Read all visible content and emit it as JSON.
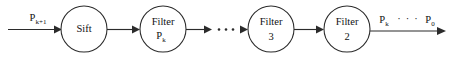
{
  "diagram": {
    "background_color": "#ffffff",
    "stroke_color": "#2b2b2b",
    "text_color": "#111111",
    "nodes": [
      {
        "id": "sift",
        "shape": "circle",
        "line1": "Sift",
        "line2": "",
        "line2_sub": "",
        "cx": 84,
        "cy": 29,
        "r": 23
      },
      {
        "id": "filter-pk",
        "shape": "circle",
        "line1": "Filter",
        "line2": "P",
        "line2_sub": "k",
        "cx": 163,
        "cy": 29,
        "r": 23
      },
      {
        "id": "filter-3",
        "shape": "circle",
        "line1": "Filter",
        "line2": "3",
        "line2_sub": "",
        "cx": 271,
        "cy": 29,
        "r": 23
      },
      {
        "id": "filter-2",
        "shape": "circle",
        "line1": "Filter",
        "line2": "2",
        "line2_sub": "",
        "cx": 347,
        "cy": 29,
        "r": 23
      }
    ],
    "edges": [
      {
        "id": "input-to-sift",
        "from": "input",
        "to": "sift",
        "label_base": "P",
        "label_sub": "k+1",
        "label_dots": ""
      },
      {
        "id": "sift-to-filter-pk",
        "from": "sift",
        "to": "filter-pk",
        "label_base": "",
        "label_sub": "",
        "label_dots": ""
      },
      {
        "id": "filter-pk-to-dots",
        "from": "filter-pk",
        "to": "ellipsis",
        "label_base": "",
        "label_sub": "",
        "label_dots": ""
      },
      {
        "id": "dots-to-filter-3",
        "from": "ellipsis",
        "to": "filter-3",
        "label_base": "",
        "label_sub": "",
        "label_dots": ""
      },
      {
        "id": "filter-3-to-filter-2",
        "from": "filter-3",
        "to": "filter-2",
        "label_base": "",
        "label_sub": "",
        "label_dots": ""
      },
      {
        "id": "filter-2-to-output",
        "from": "filter-2",
        "to": "output",
        "label_base": "P",
        "label_sub": "k",
        "label_dots": "· · ·",
        "label_base2": "P",
        "label_sub2": "0"
      }
    ],
    "ellipsis": {
      "id": "mid-ellipsis",
      "text": "· · ·",
      "dot_count": 3
    }
  }
}
